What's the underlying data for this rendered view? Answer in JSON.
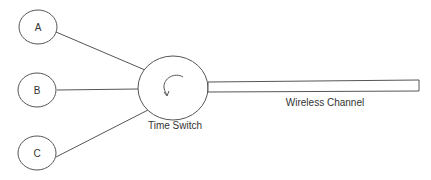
{
  "nodes": [
    {
      "id": "A",
      "label": "A"
    },
    {
      "id": "B",
      "label": "B"
    },
    {
      "id": "C",
      "label": "C"
    }
  ],
  "switch": {
    "label": "Time Switch"
  },
  "channel": {
    "label": "Wireless Channel"
  },
  "colors": {
    "stroke": "#555555",
    "text": "#333333"
  }
}
